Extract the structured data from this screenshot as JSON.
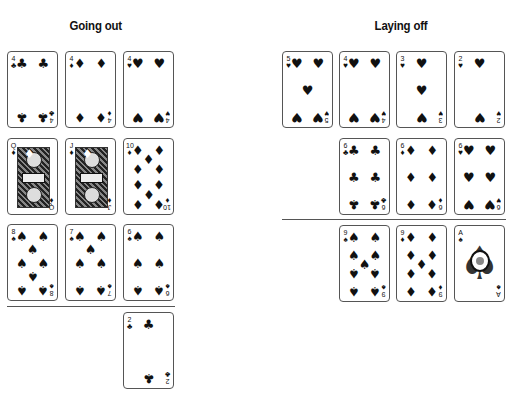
{
  "panels": {
    "left": {
      "title": "Going out",
      "rows": [
        [
          {
            "rank": "4",
            "suit": "♣",
            "suit_name": "clubs"
          },
          {
            "rank": "4",
            "suit": "♦",
            "suit_name": "diamonds"
          },
          {
            "rank": "4",
            "suit": "♥",
            "suit_name": "hearts"
          }
        ],
        [
          {
            "rank": "Q",
            "suit": "♦",
            "suit_name": "diamonds"
          },
          {
            "rank": "J",
            "suit": "♦",
            "suit_name": "diamonds"
          },
          {
            "rank": "10",
            "suit": "♦",
            "suit_name": "diamonds"
          }
        ],
        [
          {
            "rank": "8",
            "suit": "♠",
            "suit_name": "spades"
          },
          {
            "rank": "7",
            "suit": "♠",
            "suit_name": "spades"
          },
          {
            "rank": "6",
            "suit": "♠",
            "suit_name": "spades"
          }
        ]
      ],
      "discard": {
        "rank": "2",
        "suit": "♣",
        "suit_name": "clubs"
      }
    },
    "right": {
      "title": "Laying off",
      "rows": [
        [
          {
            "rank": "5",
            "suit": "♥",
            "suit_name": "hearts"
          },
          {
            "rank": "4",
            "suit": "♥",
            "suit_name": "hearts"
          },
          {
            "rank": "3",
            "suit": "♥",
            "suit_name": "hearts"
          },
          {
            "rank": "2",
            "suit": "♥",
            "suit_name": "hearts"
          }
        ],
        [
          {
            "rank": "6",
            "suit": "♣",
            "suit_name": "clubs"
          },
          {
            "rank": "6",
            "suit": "♦",
            "suit_name": "diamonds"
          },
          {
            "rank": "6",
            "suit": "♥",
            "suit_name": "hearts"
          }
        ],
        [
          {
            "rank": "9",
            "suit": "♠",
            "suit_name": "spades"
          },
          {
            "rank": "9",
            "suit": "♦",
            "suit_name": "diamonds"
          },
          {
            "rank": "A",
            "suit": "♠",
            "suit_name": "spades"
          }
        ]
      ]
    }
  }
}
